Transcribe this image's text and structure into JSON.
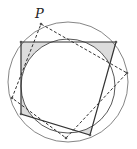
{
  "diagram": {
    "type": "geometry",
    "labels": {
      "point_p": "P"
    },
    "colors": {
      "stroke": "#333333",
      "shade": "#dcdcdc",
      "circle": "#555555",
      "background": "#ffffff"
    },
    "outer_circle": {
      "cx": 68,
      "cy": 82,
      "r": 60
    },
    "inner_circle": {
      "cx": 68,
      "cy": 82,
      "r": 47
    },
    "solid_quad": [
      [
        21,
        42
      ],
      [
        116,
        42
      ],
      [
        90,
        135
      ],
      [
        21,
        114
      ]
    ],
    "dashed_quad": [
      [
        41,
        24
      ],
      [
        127,
        73
      ],
      [
        66,
        138
      ],
      [
        12,
        98
      ]
    ],
    "points": [
      [
        41,
        24
      ],
      [
        21,
        42
      ],
      [
        116,
        42
      ],
      [
        127,
        73
      ],
      [
        90,
        135
      ],
      [
        66,
        138
      ],
      [
        21,
        114
      ],
      [
        12,
        98
      ]
    ]
  }
}
